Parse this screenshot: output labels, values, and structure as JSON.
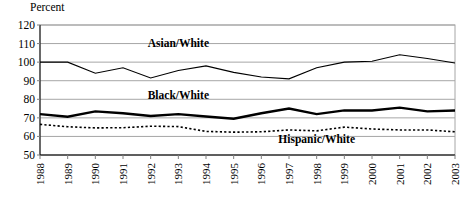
{
  "figure": {
    "cropped_title_fragment": "",
    "yaxis_title": "Percent"
  },
  "chart_data": {
    "type": "line",
    "title": "",
    "xlabel": "",
    "ylabel": "Percent",
    "ylim": [
      50,
      120
    ],
    "yticks": [
      50,
      60,
      70,
      80,
      90,
      100,
      110,
      120
    ],
    "ytick_labels": [
      "50",
      "60",
      "70",
      "80",
      "90",
      "100",
      "110",
      "120"
    ],
    "grid": true,
    "legend_position": "inline-annotations",
    "categories": [
      1988,
      1989,
      1990,
      1991,
      1992,
      1993,
      1994,
      1995,
      1996,
      1997,
      1998,
      1999,
      2000,
      2001,
      2002,
      2003
    ],
    "xtick_labels": [
      "1988",
      "1989",
      "1990",
      "1991",
      "1992",
      "1993",
      "1994",
      "1995",
      "1996",
      "1997",
      "1998",
      "1999",
      "2000",
      "2001",
      "2002",
      "2003"
    ],
    "series": [
      {
        "name": "Asian/White",
        "label": "Asian/White",
        "style": "solid-thin",
        "values": [
          100,
          100,
          94,
          97,
          91.5,
          95.5,
          98,
          94.5,
          92,
          91,
          97,
          100,
          100.5,
          104,
          102,
          99.5
        ]
      },
      {
        "name": "Black/White",
        "label": "Black/White",
        "style": "solid-thick",
        "values": [
          72,
          70.6,
          73.5,
          72.5,
          71,
          72,
          70.7,
          69.5,
          72.5,
          75,
          72,
          74,
          74,
          75.5,
          73.5,
          74
        ]
      },
      {
        "name": "Hispanic/White",
        "label": "Hispanic/White",
        "style": "dotted",
        "values": [
          66.5,
          65.2,
          64.6,
          64.7,
          65.5,
          65.3,
          62.7,
          62.3,
          62.5,
          63.5,
          63,
          65,
          64,
          63.5,
          63.5,
          62.5
        ]
      }
    ],
    "annotations": [
      {
        "text": "Asian/White",
        "x_year": 1993,
        "y_value": 108
      },
      {
        "text": "Black/White",
        "x_year": 1993,
        "y_value": 80
      },
      {
        "text": "Hispanic/White",
        "x_year": 1998,
        "y_value": 56.5
      }
    ]
  }
}
